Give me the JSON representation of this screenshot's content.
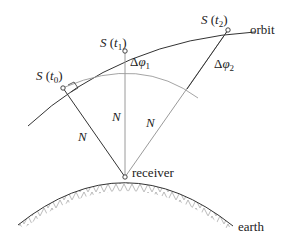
{
  "diagram": {
    "labels": {
      "s_t0": "S(t₀)",
      "s_t1": "S(t₁)",
      "s_t2": "S(t₂)",
      "orbit": "orbit",
      "receiver": "receiver",
      "earth": "earth",
      "delta_phi_1": "Δφ₁",
      "delta_phi_2": "Δφ₂",
      "n_left": "N",
      "n_middle": "N",
      "n_right": "N"
    },
    "points": {
      "s_t0": [
        63,
        88
      ],
      "s_t1": [
        125,
        51
      ],
      "s_t2": [
        228,
        30
      ],
      "receiver": [
        125,
        177
      ]
    },
    "colors": {
      "line": "#333333",
      "light_line": "#9a9a9a",
      "hatch": "#a0a0a0"
    }
  }
}
